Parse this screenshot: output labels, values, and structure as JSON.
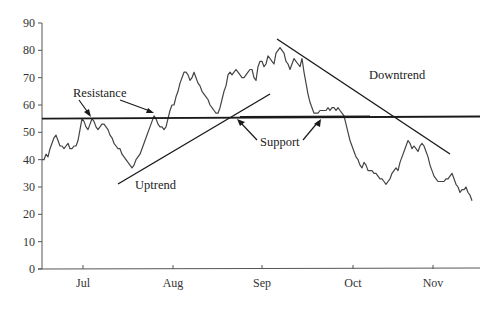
{
  "chart_data": {
    "type": "line",
    "title": "",
    "xlabel": "",
    "ylabel": "",
    "ylim": [
      0,
      90
    ],
    "yticks": [
      0,
      10,
      20,
      30,
      40,
      50,
      60,
      70,
      80,
      90
    ],
    "xticks": [
      {
        "label": "Jul",
        "px": 83
      },
      {
        "label": "Aug",
        "px": 173
      },
      {
        "label": "Sep",
        "px": 262
      },
      {
        "label": "Oct",
        "px": 353
      },
      {
        "label": "Nov",
        "px": 433
      }
    ],
    "grid": false,
    "legend": null,
    "series": [
      {
        "name": "Price",
        "points_px_x": [
          42,
          44,
          46,
          48,
          50,
          52,
          54,
          56,
          58,
          60,
          62,
          64,
          66,
          68,
          70,
          72,
          74,
          76,
          78,
          80,
          82,
          84,
          86,
          88,
          90,
          92,
          94,
          96,
          98,
          100,
          102,
          104,
          106,
          108,
          110,
          112,
          114,
          116,
          118,
          120,
          122,
          124,
          126,
          128,
          130,
          132,
          134,
          136,
          138,
          140,
          142,
          144,
          146,
          148,
          150,
          152,
          154,
          156,
          158,
          160,
          162,
          164,
          166,
          168,
          170,
          172,
          174,
          176,
          178,
          180,
          182,
          184,
          186,
          188,
          190,
          192,
          194,
          196,
          198,
          200,
          202,
          204,
          206,
          208,
          210,
          212,
          214,
          216,
          218,
          220,
          222,
          224,
          226,
          228,
          230,
          232,
          234,
          236,
          238,
          240,
          242,
          244,
          246,
          248,
          250,
          252,
          254,
          256,
          258,
          260,
          262,
          264,
          266,
          268,
          270,
          272,
          274,
          276,
          278,
          280,
          282,
          284,
          286,
          288,
          290,
          292,
          294,
          296,
          298,
          300,
          302,
          304,
          306,
          308,
          310,
          312,
          314,
          316,
          318,
          320,
          322,
          324,
          326,
          328,
          330,
          332,
          334,
          336,
          338,
          340,
          342,
          344,
          346,
          348,
          350,
          352,
          354,
          356,
          358,
          360,
          362,
          364,
          366,
          368,
          370,
          372,
          374,
          376,
          378,
          380,
          382,
          384,
          386,
          388,
          390,
          392,
          394,
          396,
          398,
          400,
          402,
          404,
          406,
          408,
          410,
          412,
          414,
          416,
          418,
          420,
          422,
          424,
          426,
          428,
          430,
          432,
          434,
          436,
          438,
          440,
          442,
          444,
          446,
          448,
          450,
          452,
          454,
          456,
          458,
          460,
          462,
          464,
          466,
          468,
          470,
          472,
          474,
          476,
          478
        ],
        "values": [
          40,
          40,
          42,
          41,
          44,
          46,
          48,
          49,
          47,
          45,
          45,
          44,
          45,
          46,
          44,
          44,
          45,
          45,
          47,
          51,
          55,
          54,
          52,
          51,
          53,
          55,
          54,
          52,
          51,
          52,
          53,
          53,
          52,
          51,
          49,
          48,
          46,
          45,
          44,
          44,
          42,
          41,
          40,
          39,
          38,
          37,
          38,
          40,
          41,
          42,
          44,
          46,
          48,
          50,
          52,
          54,
          56,
          55,
          53,
          52,
          52,
          51,
          52,
          55,
          58,
          60,
          60,
          63,
          65,
          68,
          70,
          72,
          72,
          71,
          69,
          70,
          72,
          70,
          68,
          67,
          65,
          64,
          63,
          62,
          60,
          59,
          58,
          57,
          57,
          59,
          62,
          65,
          67,
          71,
          72,
          71,
          72,
          73,
          72,
          71,
          70,
          70,
          71,
          72,
          73,
          73,
          70,
          69,
          74,
          76,
          76,
          74,
          75,
          78,
          77,
          76,
          75,
          79,
          80,
          81,
          80,
          79,
          76,
          75,
          73,
          75,
          77,
          76,
          75,
          74,
          77,
          72,
          68,
          64,
          61,
          59,
          57,
          57,
          57,
          58,
          58,
          58,
          58,
          59,
          58,
          59,
          59,
          58,
          59,
          58,
          57,
          56,
          53,
          50,
          47,
          45,
          43,
          41,
          40,
          38,
          37,
          39,
          38,
          36,
          36,
          36,
          35,
          35,
          34,
          33,
          33,
          32,
          31,
          32,
          33,
          35,
          36,
          37,
          36,
          39,
          41,
          43,
          45,
          47,
          46,
          44,
          45,
          44,
          43,
          45,
          46,
          45,
          43,
          41,
          38,
          36,
          34,
          33,
          32,
          32,
          32,
          32,
          33,
          33,
          34,
          35,
          33,
          31,
          30,
          28,
          29,
          29,
          30,
          28,
          27,
          25
        ],
        "approx_ohlc_note": ""
      }
    ],
    "annotations": [
      {
        "text": "Resistance",
        "type": "horizontal-line",
        "value": 55,
        "x_px": [
          42,
          480
        ]
      },
      {
        "text": "Support",
        "type": "horizontal-line",
        "value": 55.6,
        "x_px": [
          240,
          370
        ]
      },
      {
        "text": "Uptrend",
        "type": "trend-line",
        "from_px": [
          118,
          184
        ],
        "to_px": [
          270,
          94
        ]
      },
      {
        "text": "Downtrend",
        "type": "trend-line",
        "from_px": [
          277,
          39
        ],
        "to_px": [
          450,
          154
        ]
      }
    ]
  },
  "labels": {
    "resistance": "Resistance",
    "support": "Support",
    "uptrend": "Uptrend",
    "downtrend": "Downtrend"
  }
}
